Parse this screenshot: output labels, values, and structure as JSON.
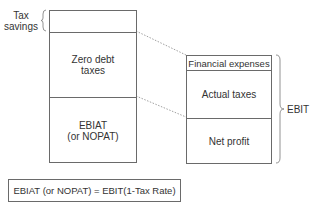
{
  "left_stack": {
    "tax_savings_label_line1": "Tax",
    "tax_savings_label_line2": "savings",
    "zero_debt_line1": "Zero debt",
    "zero_debt_line2": "taxes",
    "ebiat_line1": "EBIAT",
    "ebiat_line2": "(or NOPAT)"
  },
  "right_stack": {
    "financial_expenses": "Financial expenses",
    "actual_taxes": "Actual taxes",
    "net_profit": "Net profit",
    "bracket_label": "EBIT"
  },
  "formula": "EBIAT (or NOPAT) = EBIT(1-Tax Rate)",
  "colors": {
    "line": "#6a6a6a",
    "text": "#333333"
  }
}
